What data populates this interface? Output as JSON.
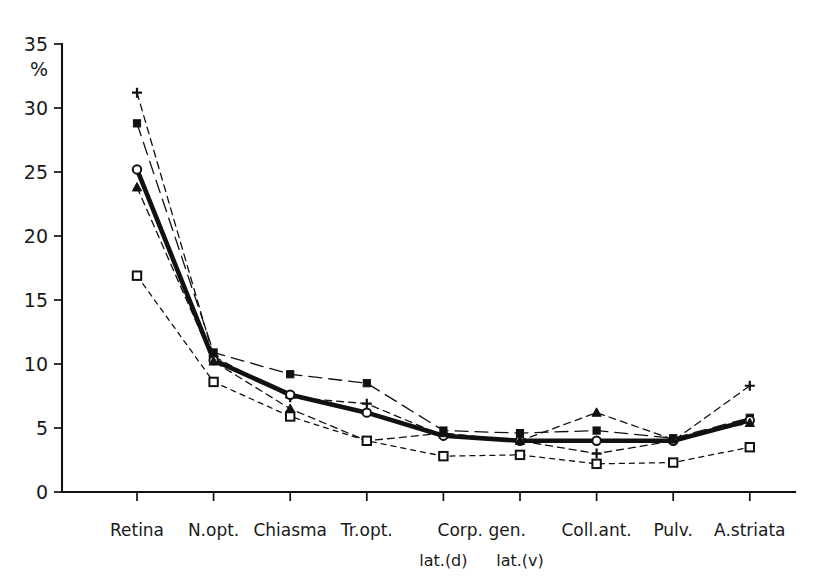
{
  "chart_data": {
    "type": "line",
    "title": "",
    "xlabel": "",
    "ylabel": "%",
    "ylim": [
      0,
      35
    ],
    "yticks": [
      0,
      5,
      10,
      15,
      20,
      25,
      30,
      35
    ],
    "grid": false,
    "legend_position": "none",
    "categories": [
      "Retina",
      "N.opt.",
      "Chiasma",
      "Tr.opt.",
      "Corp. gen.",
      "Corp. gen.",
      "Coll.ant.",
      "Pulv.",
      "A.striata"
    ],
    "category_sublabels": [
      "",
      "",
      "",
      "",
      "lat.(d)",
      "lat.(v)",
      "",
      "",
      ""
    ],
    "series": [
      {
        "name": "series-plus",
        "marker": "plus",
        "linestyle": "dashed",
        "linewidth": 1.3,
        "values": [
          31.2,
          10.6,
          7.4,
          6.9,
          4.4,
          4.0,
          3.0,
          4.0,
          8.3
        ]
      },
      {
        "name": "series-filled-square",
        "marker": "filled-square",
        "linestyle": "long-dash",
        "linewidth": 1.3,
        "values": [
          28.8,
          10.9,
          9.2,
          8.5,
          4.8,
          4.6,
          4.8,
          4.2,
          5.8
        ]
      },
      {
        "name": "series-open-circle",
        "marker": "open-circle",
        "linestyle": "solid-thick",
        "linewidth": 4.6,
        "values": [
          25.2,
          10.3,
          7.6,
          6.2,
          4.4,
          4.0,
          4.0,
          4.0,
          5.6
        ]
      },
      {
        "name": "series-filled-triangle",
        "marker": "filled-triangle",
        "linestyle": "dashed",
        "linewidth": 1.3,
        "values": [
          23.8,
          10.2,
          6.5,
          4.0,
          4.6,
          4.0,
          6.2,
          4.1,
          5.4
        ]
      },
      {
        "name": "series-open-square",
        "marker": "open-square",
        "linestyle": "dotted-dash",
        "linewidth": 1.3,
        "values": [
          16.9,
          8.6,
          5.9,
          4.0,
          2.8,
          2.9,
          2.2,
          2.3,
          3.5
        ]
      }
    ],
    "colors": {
      "axis": "#111111",
      "ink": "#1a1a1a",
      "background": "#ffffff"
    }
  },
  "axis": {
    "y_unit_label": "%",
    "y_tick_labels": [
      "0",
      "5",
      "10",
      "15",
      "20",
      "25",
      "30",
      "35"
    ]
  }
}
